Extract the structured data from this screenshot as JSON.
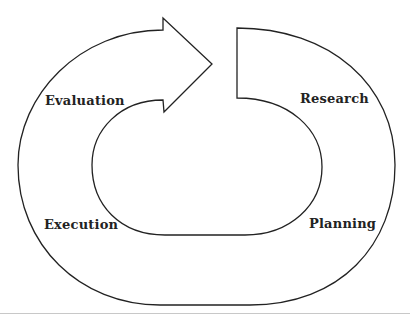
{
  "diagram": {
    "type": "cycle",
    "stages": [
      {
        "id": "research",
        "label": "Research"
      },
      {
        "id": "planning",
        "label": "Planning"
      },
      {
        "id": "execution",
        "label": "Execution"
      },
      {
        "id": "evaluation",
        "label": "Evaluation"
      }
    ],
    "stroke_color": "#222222"
  }
}
